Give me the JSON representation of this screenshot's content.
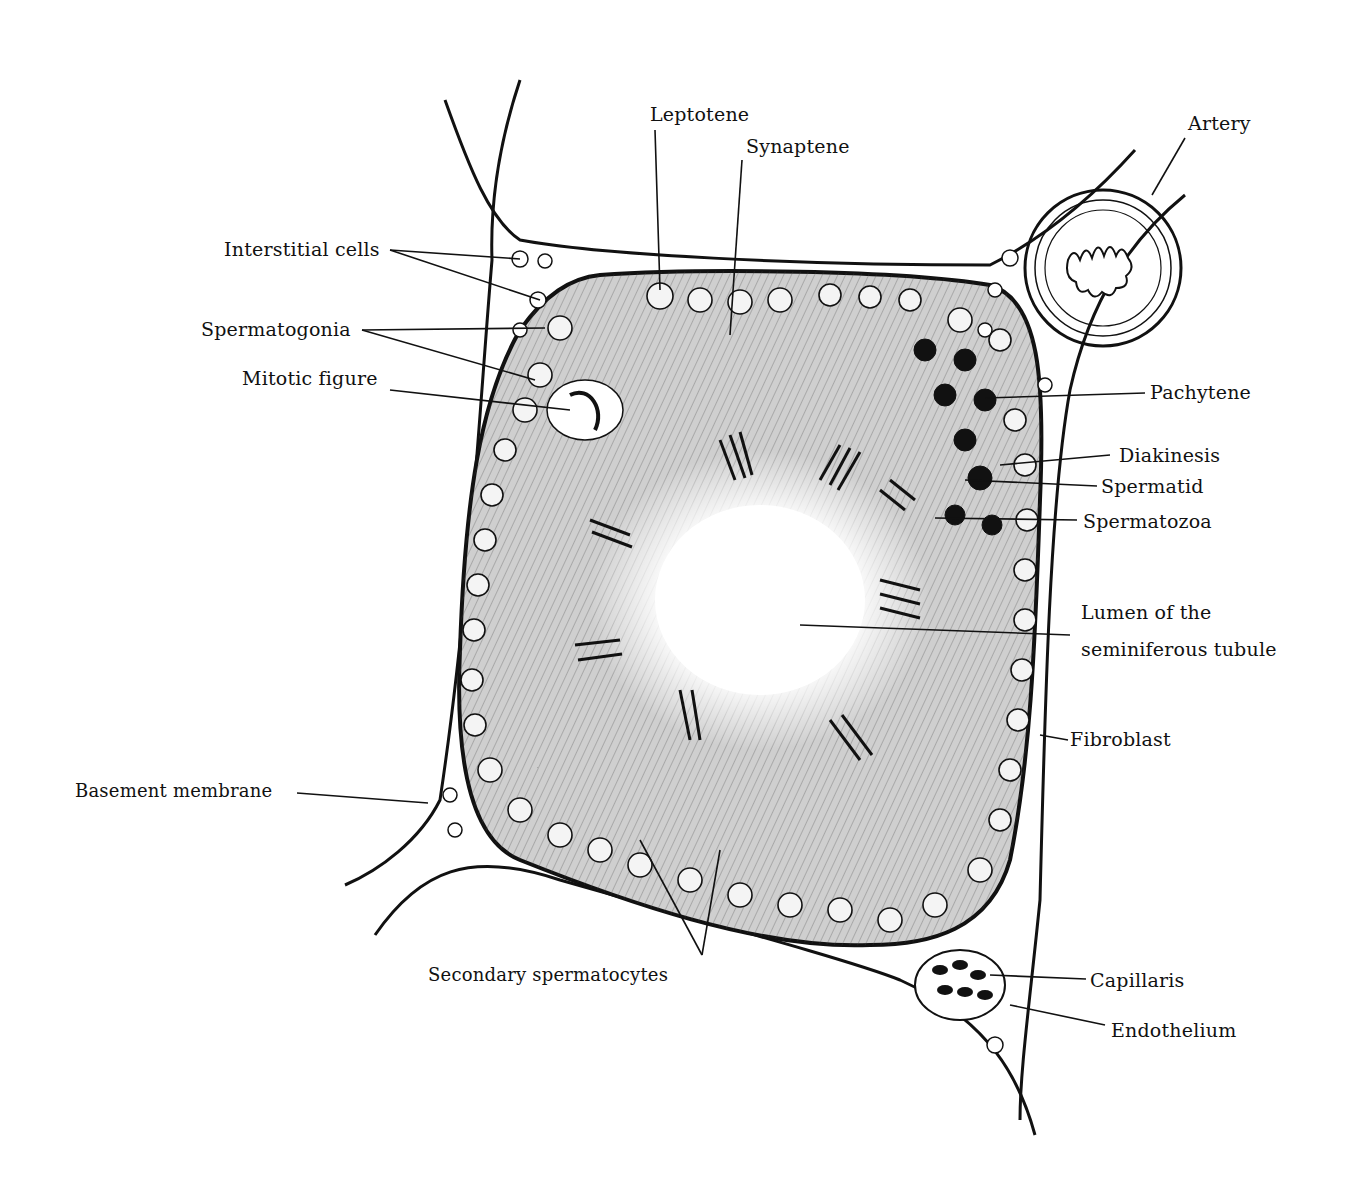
{
  "diagram": {
    "labels": {
      "leptotene": "Leptotene",
      "synaptene": "Synaptene",
      "artery": "Artery",
      "interstitial_cells": "Interstitial cells",
      "spermatogonia": "Spermatogonia",
      "mitotic_figure": "Mitotic figure",
      "pachytene": "Pachytene",
      "diakinesis": "Diakinesis",
      "spermatid": "Spermatid",
      "spermatozoa": "Spermatozoa",
      "lumen_line1": "Lumen of the",
      "lumen_line2": "seminiferous tubule",
      "fibroblast": "Fibroblast",
      "basement_membrane": "Basement membrane",
      "secondary_spermatocytes": "Secondary spermatocytes",
      "capillaris": "Capillaris",
      "endothelium": "Endothelium"
    },
    "colors": {
      "ink": "#111111",
      "paper": "#ffffff",
      "tissue": "#d9d9d9"
    }
  }
}
